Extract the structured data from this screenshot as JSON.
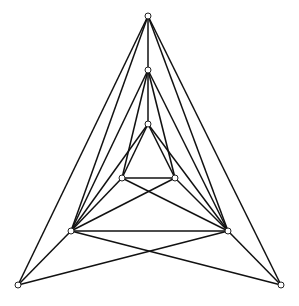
{
  "diagram": {
    "type": "graph",
    "width": 299,
    "height": 306,
    "colors": {
      "edge": "#111111",
      "node_fill": "#ffffff",
      "node_stroke": "#222222",
      "background": "#ffffff"
    },
    "nodes": [
      {
        "id": "A",
        "x": 148,
        "y": 16
      },
      {
        "id": "B",
        "x": 148,
        "y": 70
      },
      {
        "id": "C",
        "x": 148,
        "y": 124
      },
      {
        "id": "D",
        "x": 122,
        "y": 178
      },
      {
        "id": "E",
        "x": 175,
        "y": 178
      },
      {
        "id": "F",
        "x": 71,
        "y": 231
      },
      {
        "id": "G",
        "x": 228,
        "y": 231
      },
      {
        "id": "H",
        "x": 18,
        "y": 285
      },
      {
        "id": "I",
        "x": 281,
        "y": 285
      }
    ],
    "edges": [
      [
        "A",
        "B"
      ],
      [
        "A",
        "H"
      ],
      [
        "A",
        "I"
      ],
      [
        "A",
        "F"
      ],
      [
        "A",
        "G"
      ],
      [
        "B",
        "C"
      ],
      [
        "B",
        "D"
      ],
      [
        "B",
        "E"
      ],
      [
        "B",
        "F"
      ],
      [
        "B",
        "G"
      ],
      [
        "C",
        "D"
      ],
      [
        "C",
        "E"
      ],
      [
        "C",
        "F"
      ],
      [
        "C",
        "G"
      ],
      [
        "D",
        "E"
      ],
      [
        "D",
        "F"
      ],
      [
        "D",
        "G"
      ],
      [
        "E",
        "F"
      ],
      [
        "E",
        "G"
      ],
      [
        "F",
        "G"
      ],
      [
        "F",
        "H"
      ],
      [
        "F",
        "I"
      ],
      [
        "G",
        "H"
      ],
      [
        "G",
        "I"
      ]
    ]
  }
}
